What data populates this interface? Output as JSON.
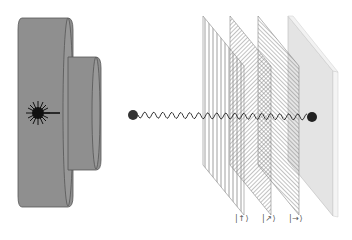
{
  "diagram": {
    "colors": {
      "laser_body": "#8e8e8e",
      "laser_edge": "#555555",
      "photon": "#2a2a2a",
      "wave": "#333333",
      "screen": "#e6e6e6",
      "plate_lines": "#777777"
    },
    "components": [
      {
        "name": "laser",
        "icon": "laser-starburst-icon"
      },
      {
        "name": "photon-source",
        "icon": "photon-dot"
      },
      {
        "name": "polarizer-vertical",
        "orientation": "vertical"
      },
      {
        "name": "polarizer-diagonal",
        "orientation": "diagonal"
      },
      {
        "name": "polarizer-horizontal",
        "orientation": "horizontal"
      },
      {
        "name": "detector-screen"
      }
    ],
    "labels": {
      "polarizer_1": "|↑⟩",
      "polarizer_2": "|↗⟩",
      "polarizer_3": "|→⟩"
    }
  }
}
